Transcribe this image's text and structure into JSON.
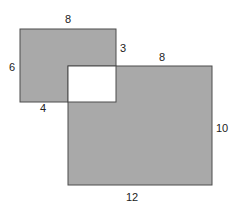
{
  "diagram": {
    "type": "overlapping-rectangles",
    "colors": {
      "fill": "#a9a9a9",
      "stroke": "#4d4d4d",
      "hole": "#ffffff",
      "label": "#222222"
    },
    "small_rect": {
      "x": 20,
      "y": 29,
      "w": 96,
      "h": 73
    },
    "large_rect": {
      "x": 68,
      "y": 66,
      "w": 144,
      "h": 119
    },
    "overlap_hole": {
      "x": 68,
      "y": 66,
      "w": 48,
      "h": 36
    },
    "labels": {
      "small_top": "8",
      "small_left": "6",
      "small_bottom": "4",
      "overlap_right": "3",
      "large_top": "8",
      "large_right": "10",
      "large_bottom": "12"
    }
  }
}
